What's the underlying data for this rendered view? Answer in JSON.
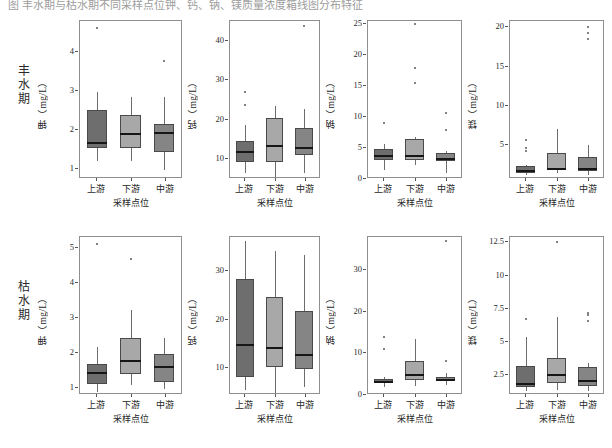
{
  "caption": {
    "text": "图 丰水期与枯水期不同采样点位钾、钙、钠、镁质量浓度箱线图分布特征"
  },
  "rows": [
    {
      "id": "wet",
      "label": "丰水期"
    },
    {
      "id": "dry",
      "label": "枯水期"
    }
  ],
  "axis": {
    "x_title": "采样点位",
    "x_categories": [
      "上游",
      "下游",
      "中游"
    ]
  },
  "colors": {
    "box_upstream": "#6e6e6e",
    "box_downstream": "#a8a8a8",
    "box_midstream": "#858585",
    "median": "#161616",
    "whisker": "#6d6d6d",
    "frame": "#8f8f8f",
    "outlier": "#5a5a5a"
  },
  "chart_data": [
    {
      "type": "box",
      "panel": "wet-potassium",
      "season": "丰水期",
      "title": "",
      "ylabel": "钾（mg/L）",
      "xlabel": "采样点位",
      "ylim": [
        0.75,
        4.8
      ],
      "yticks": [
        1,
        2,
        3,
        4
      ],
      "categories": [
        "上游",
        "下游",
        "中游"
      ],
      "boxes": [
        {
          "category": "上游",
          "min": 1.22,
          "q1": 1.55,
          "median": 1.7,
          "q3": 2.52,
          "max": 2.97,
          "outliers": [
            4.62
          ]
        },
        {
          "category": "下游",
          "min": 1.22,
          "q1": 1.55,
          "median": 1.92,
          "q3": 2.4,
          "max": 2.84,
          "outliers": []
        },
        {
          "category": "中游",
          "min": 0.98,
          "q1": 1.45,
          "median": 1.95,
          "q3": 2.16,
          "max": 2.84,
          "outliers": [
            3.78
          ]
        }
      ]
    },
    {
      "type": "box",
      "panel": "wet-calcium",
      "season": "丰水期",
      "title": "",
      "ylabel": "钙（mg/L）",
      "xlabel": "采样点位",
      "ylim": [
        5,
        45
      ],
      "yticks": [
        10,
        20,
        30,
        40
      ],
      "categories": [
        "上游",
        "下游",
        "中游"
      ],
      "boxes": [
        {
          "category": "上游",
          "min": 6.4,
          "q1": 9.3,
          "median": 12.0,
          "q3": 14.5,
          "max": 18.6,
          "outliers": [
            23.8,
            26.9
          ]
        },
        {
          "category": "下游",
          "min": 5.6,
          "q1": 9.4,
          "median": 13.6,
          "q3": 20.4,
          "max": 23.6,
          "outliers": []
        },
        {
          "category": "中游",
          "min": 6.6,
          "q1": 11.0,
          "median": 13.0,
          "q3": 17.9,
          "max": 22.6,
          "outliers": [
            43.8
          ]
        }
      ]
    },
    {
      "type": "box",
      "panel": "wet-sodium",
      "season": "丰水期",
      "title": "",
      "ylabel": "钠（mg/L）",
      "xlabel": "采样点位",
      "ylim": [
        0,
        25.5
      ],
      "yticks": [
        0,
        5,
        10,
        15,
        20,
        25
      ],
      "categories": [
        "上游",
        "下游",
        "中游"
      ],
      "boxes": [
        {
          "category": "上游",
          "min": 1.4,
          "q1": 3.0,
          "median": 3.8,
          "q3": 4.8,
          "max": 5.6,
          "outliers": [
            9.0
          ]
        },
        {
          "category": "下游",
          "min": 2.2,
          "q1": 3.1,
          "median": 3.8,
          "q3": 6.4,
          "max": 6.7,
          "outliers": [
            15.5,
            17.9,
            25.0
          ]
        },
        {
          "category": "中游",
          "min": 0.9,
          "q1": 2.9,
          "median": 3.4,
          "q3": 4.2,
          "max": 4.5,
          "outliers": [
            7.9,
            10.7
          ]
        }
      ]
    },
    {
      "type": "box",
      "panel": "wet-magnesium",
      "season": "丰水期",
      "title": "",
      "ylabel": "镁（mg/L）",
      "xlabel": "采样点位",
      "ylim": [
        0.7,
        20.8
      ],
      "yticks": [
        5,
        10,
        15,
        20
      ],
      "categories": [
        "上游",
        "下游",
        "中游"
      ],
      "boxes": [
        {
          "category": "上游",
          "min": 1.2,
          "q1": 1.5,
          "median": 1.9,
          "q3": 2.3,
          "max": 2.5,
          "outliers": [
            4.3,
            4.7,
            5.6
          ]
        },
        {
          "category": "下游",
          "min": 1.4,
          "q1": 1.9,
          "median": 2.1,
          "q3": 4.0,
          "max": 7.1,
          "outliers": []
        },
        {
          "category": "中游",
          "min": 1.2,
          "q1": 1.7,
          "median": 2.1,
          "q3": 3.5,
          "max": 5.0,
          "outliers": [
            18.5,
            19.3,
            20.1
          ]
        }
      ]
    },
    {
      "type": "box",
      "panel": "dry-potassium",
      "season": "枯水期",
      "title": "",
      "ylabel": "钾（mg/L）",
      "xlabel": "采样点位",
      "ylim": [
        0.8,
        5.3
      ],
      "yticks": [
        1,
        2,
        3,
        4,
        5
      ],
      "categories": [
        "上游",
        "下游",
        "中游"
      ],
      "boxes": [
        {
          "category": "上游",
          "min": 0.88,
          "q1": 1.1,
          "median": 1.45,
          "q3": 1.67,
          "max": 2.17,
          "outliers": [
            5.1
          ]
        },
        {
          "category": "下游",
          "min": 1.08,
          "q1": 1.4,
          "median": 1.8,
          "q3": 2.42,
          "max": 3.22,
          "outliers": [
            4.66
          ]
        },
        {
          "category": "中游",
          "min": 0.96,
          "q1": 1.16,
          "median": 1.62,
          "q3": 1.98,
          "max": 2.42,
          "outliers": []
        }
      ]
    },
    {
      "type": "box",
      "panel": "dry-calcium",
      "season": "枯水期",
      "title": "",
      "ylabel": "钙（mg/L）",
      "xlabel": "采样点位",
      "ylim": [
        4.5,
        37
      ],
      "yticks": [
        10,
        20,
        30
      ],
      "categories": [
        "上游",
        "下游",
        "中游"
      ],
      "boxes": [
        {
          "category": "上游",
          "min": 5.6,
          "q1": 8.2,
          "median": 15.0,
          "q3": 28.3,
          "max": 36.2,
          "outliers": []
        },
        {
          "category": "下游",
          "min": 5.0,
          "q1": 10.2,
          "median": 14.4,
          "q3": 24.6,
          "max": 34.2,
          "outliers": []
        },
        {
          "category": "中游",
          "min": 6.2,
          "q1": 9.8,
          "median": 13.0,
          "q3": 21.8,
          "max": 33.3,
          "outliers": []
        }
      ]
    },
    {
      "type": "box",
      "panel": "dry-sodium",
      "season": "枯水期",
      "title": "",
      "ylabel": "钠（mg/L）",
      "xlabel": "采样点位",
      "ylim": [
        0,
        38
      ],
      "yticks": [
        0,
        10,
        20,
        30
      ],
      "categories": [
        "上游",
        "下游",
        "中游"
      ],
      "boxes": [
        {
          "category": "上游",
          "min": 2.0,
          "q1": 2.9,
          "median": 3.3,
          "q3": 3.9,
          "max": 4.4,
          "outliers": [
            11.0,
            14.0
          ]
        },
        {
          "category": "下游",
          "min": 2.2,
          "q1": 3.6,
          "median": 5.1,
          "q3": 8.1,
          "max": 13.4,
          "outliers": []
        },
        {
          "category": "中游",
          "min": 2.4,
          "q1": 3.5,
          "median": 3.9,
          "q3": 4.4,
          "max": 5.2,
          "outliers": [
            8.1,
            37.0
          ]
        }
      ]
    },
    {
      "type": "box",
      "panel": "dry-magnesium",
      "season": "枯水期",
      "title": "",
      "ylabel": "镁（mg/L）",
      "xlabel": "采样点位",
      "ylim": [
        1.0,
        12.9
      ],
      "yticks": [
        2.5,
        5.0,
        7.5,
        10.0,
        12.5
      ],
      "categories": [
        "上游",
        "下游",
        "中游"
      ],
      "boxes": [
        {
          "category": "上游",
          "min": 1.3,
          "q1": 1.6,
          "median": 1.9,
          "q3": 3.2,
          "max": 5.4,
          "outliers": [
            6.7
          ]
        },
        {
          "category": "下游",
          "min": 1.4,
          "q1": 1.9,
          "median": 2.6,
          "q3": 3.8,
          "max": 6.9,
          "outliers": [
            12.5
          ]
        },
        {
          "category": "中游",
          "min": 1.3,
          "q1": 1.7,
          "median": 2.1,
          "q3": 3.1,
          "max": 3.4,
          "outliers": [
            6.6,
            7.0,
            7.2
          ]
        }
      ]
    }
  ]
}
